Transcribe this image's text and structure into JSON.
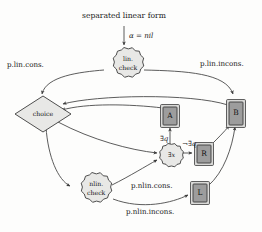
{
  "figure": {
    "title": "separated linear form",
    "entry_edge_label": "α = nil"
  },
  "nodes": {
    "lin_check": {
      "label_line1": "lin.",
      "label_line2": "check",
      "shape": "starburst",
      "color": "#e8e8e6"
    },
    "nlin_check": {
      "label_line1": "nlin.",
      "label_line2": "check",
      "shape": "starburst",
      "color": "#e8e8e6"
    },
    "choice": {
      "label": "choice",
      "shape": "diamond",
      "color": "#e0e0de"
    },
    "exists_x": {
      "label": "∃x",
      "shape": "starburst",
      "color": "#e8e8e6"
    },
    "box_a": {
      "label": "A",
      "shape": "box",
      "color": "#9d9d9d"
    },
    "box_b": {
      "label": "B",
      "shape": "box",
      "color": "#9d9d9d"
    },
    "box_r": {
      "label": "R",
      "shape": "box",
      "color": "#9d9d9d"
    },
    "box_l": {
      "label": "L",
      "shape": "box",
      "color": "#9d9d9d"
    }
  },
  "edge_labels": {
    "p_lin_cons": "p.lin.cons.",
    "p_lin_incons": "p.lin.incons.",
    "p_nlin_cons": "p.nlin.cons.",
    "p_nlin_incons": "p.nlin.incons.",
    "exists_q": "∃q",
    "not_exists_q": "¬∃q"
  },
  "colors": {
    "edge_stroke": "#4a4a4a",
    "node_stroke": "#3b3b3b",
    "node_light": "#e8e8e6",
    "node_gray": "#9d9d9d",
    "text": "#111111",
    "background": "#fdfdfc"
  }
}
